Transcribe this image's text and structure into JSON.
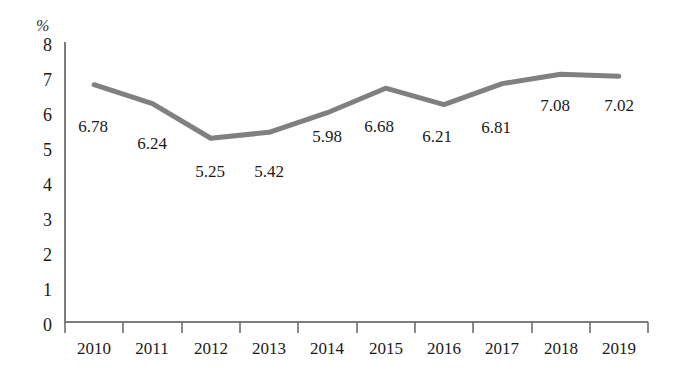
{
  "chart_data": {
    "type": "line",
    "title": "",
    "subtitle": "",
    "xlabel": "",
    "ylabel": "%",
    "unit_label": "%",
    "categories": [
      "2010",
      "2011",
      "2012",
      "2013",
      "2014",
      "2015",
      "2016",
      "2017",
      "2018",
      "2019"
    ],
    "values": [
      6.78,
      6.24,
      5.25,
      5.42,
      5.98,
      6.68,
      6.21,
      6.81,
      7.08,
      7.02
    ],
    "point_labels": [
      "6.78",
      "6.24",
      "5.25",
      "5.42",
      "5.98",
      "6.68",
      "6.21",
      "6.81",
      "7.08",
      "7.02"
    ],
    "series": [
      {
        "name": "",
        "values": [
          6.78,
          6.24,
          5.25,
          5.42,
          5.98,
          6.68,
          6.21,
          6.81,
          7.08,
          7.02
        ]
      }
    ],
    "ylim": [
      0,
      8
    ],
    "xlim_categories": [
      "2010",
      "2019"
    ],
    "yticks": [
      "8",
      "7",
      "6",
      "5",
      "4",
      "3",
      "2",
      "1",
      "0"
    ],
    "ytick_values": [
      8,
      7,
      6,
      5,
      4,
      3,
      2,
      1,
      0
    ],
    "grid": false,
    "legend": false,
    "legend_position": "none",
    "annotations": [],
    "colors": {
      "series_line": "#808080",
      "axis": "#7d7d7d",
      "text": "#1a1a1a",
      "background": "#ffffff"
    }
  },
  "axis": {
    "y_unit": "%",
    "y_tick_labels": [
      "8",
      "7",
      "6",
      "5",
      "4",
      "3",
      "2",
      "1",
      "0"
    ],
    "x_tick_labels": [
      "2010",
      "2011",
      "2012",
      "2013",
      "2014",
      "2015",
      "2016",
      "2017",
      "2018",
      "2019"
    ]
  },
  "labels": {
    "points": [
      "6.78",
      "6.24",
      "5.25",
      "5.42",
      "5.98",
      "6.68",
      "6.21",
      "6.81",
      "7.08",
      "7.02"
    ]
  }
}
